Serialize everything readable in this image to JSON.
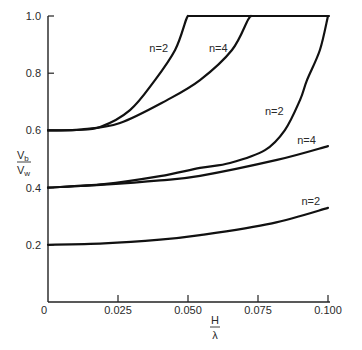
{
  "chart_data": {
    "type": "line",
    "title": "",
    "xlabel": "H/λ",
    "ylabel": "Vb/Vw",
    "xlabel_parts": {
      "numerator": "H",
      "denominator": "λ"
    },
    "ylabel_parts": {
      "numerator": "V",
      "numerator_sub": "b",
      "denominator": "V",
      "denominator_sub": "w"
    },
    "xlim": [
      0,
      0.1
    ],
    "ylim": [
      0,
      1.0
    ],
    "grid": false,
    "legend": "none (curves labeled inline)",
    "x_ticks": [
      {
        "value": 0,
        "label": "0"
      },
      {
        "value": 0.025,
        "label": "0.025"
      },
      {
        "value": 0.05,
        "label": "0.050"
      },
      {
        "value": 0.075,
        "label": "0.075"
      },
      {
        "value": 0.1,
        "label": "0.100"
      }
    ],
    "y_ticks": [
      {
        "value": 0.2,
        "label": "0.2"
      },
      {
        "value": 0.4,
        "label": "0.4"
      },
      {
        "value": 0.6,
        "label": "0.6"
      },
      {
        "value": 0.8,
        "label": "0.8"
      },
      {
        "value": 1.0,
        "label": "1.0"
      }
    ],
    "series": [
      {
        "name": "n=2 (Vb/Vw0 = 0.6)",
        "label": "n=2",
        "label_pos": [
          0.0362,
          0.875
        ],
        "x": [
          0,
          0.01,
          0.0186,
          0.0293,
          0.0382,
          0.0454,
          0.0493,
          0.05
        ],
        "y": [
          0.6,
          0.602,
          0.612,
          0.671,
          0.776,
          0.881,
          0.986,
          1.0
        ]
      },
      {
        "name": "n=4 (Vb/Vw0 = 0.6)",
        "label": "n=4",
        "label_pos": [
          0.0575,
          0.875
        ],
        "x": [
          0,
          0.012,
          0.0257,
          0.0425,
          0.0543,
          0.0657,
          0.0714,
          0.0725
        ],
        "y": [
          0.6,
          0.603,
          0.626,
          0.706,
          0.776,
          0.881,
          0.986,
          1.0
        ]
      },
      {
        "name": "n=2 (Vb/Vw0 = 0.4)",
        "label": "n=2",
        "label_pos": [
          0.0775,
          0.655
        ],
        "x": [
          0,
          0.02,
          0.04,
          0.0543,
          0.065,
          0.0775,
          0.0846,
          0.09,
          0.0925,
          0.0971,
          0.1
        ],
        "y": [
          0.4,
          0.412,
          0.44,
          0.469,
          0.486,
          0.531,
          0.601,
          0.706,
          0.776,
          0.881,
          1.0
        ]
      },
      {
        "name": "n=4 (Vb/Vw0 = 0.4)",
        "label": "n=4",
        "label_pos": [
          0.089,
          0.553
        ],
        "x": [
          0,
          0.02,
          0.04,
          0.0543,
          0.0818,
          0.1
        ],
        "y": [
          0.4,
          0.41,
          0.425,
          0.441,
          0.497,
          0.545
        ]
      },
      {
        "name": "n=2 (Vb/Vw0 = 0.2)",
        "label": "n=2",
        "label_pos": [
          0.0905,
          0.34
        ],
        "x": [
          0,
          0.02,
          0.04,
          0.0543,
          0.08,
          0.1
        ],
        "y": [
          0.2,
          0.205,
          0.218,
          0.234,
          0.275,
          0.329
        ]
      }
    ],
    "cap_line": {
      "y": 1.0,
      "x_start": 0.05,
      "x_end": 0.1,
      "note": "curves saturate at Vb/Vw = 1.0"
    }
  }
}
